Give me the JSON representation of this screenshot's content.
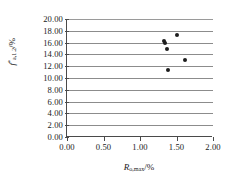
{
  "chart_data": {
    "type": "scatter",
    "title": "",
    "xlabel": "R o,max /%",
    "ylabel": "f* a,1.2 /%",
    "xlim": [
      0.0,
      2.0
    ],
    "ylim": [
      0.0,
      20.0
    ],
    "xticks": [
      "0.00",
      "0.50",
      "1.00",
      "1.50",
      "2.00"
    ],
    "yticks": [
      "0.00",
      "2.00",
      "4.00",
      "6.00",
      "8.00",
      "10.00",
      "12.00",
      "14.00",
      "16.00",
      "18.00",
      "20.00"
    ],
    "xtick_values": [
      0.0,
      0.5,
      1.0,
      1.5,
      2.0
    ],
    "ytick_values": [
      0.0,
      2.0,
      4.0,
      6.0,
      8.0,
      10.0,
      12.0,
      14.0,
      16.0,
      18.0,
      20.0
    ],
    "grid": "horizontal",
    "legend": "none",
    "marker_color": "#1d1d1d",
    "grid_color": "#8c8c8c",
    "axis_color": "#4a4a4a",
    "points": [
      {
        "x": 1.33,
        "y": 16.3
      },
      {
        "x": 1.34,
        "y": 16.0
      },
      {
        "x": 1.51,
        "y": 17.3
      },
      {
        "x": 1.37,
        "y": 14.9
      },
      {
        "x": 1.62,
        "y": 13.0
      },
      {
        "x": 1.39,
        "y": 11.3
      }
    ]
  },
  "axis_titles": {
    "y_symbol": "f",
    "y_superscript": "*",
    "y_subscript": "a,1.2",
    "y_unit": "/%",
    "x_symbol": "R",
    "x_subscript": "o,max",
    "x_unit": "/%"
  }
}
